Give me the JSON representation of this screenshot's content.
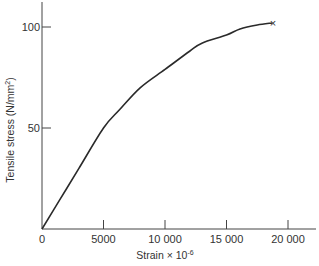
{
  "chart_data": {
    "type": "line",
    "title": "",
    "xlabel": "Strain × 10⁻⁶",
    "ylabel": "Tensile stress (N/mm²)",
    "xlim": [
      0,
      22500
    ],
    "ylim": [
      0,
      112
    ],
    "grid": false,
    "legend": null,
    "x_ticks": [
      0,
      5000,
      10000,
      15000,
      20000
    ],
    "x_tick_labels": [
      "0",
      "5000",
      "10 000",
      "15 000",
      "20 000"
    ],
    "y_ticks": [
      50,
      100
    ],
    "y_tick_labels": [
      "50",
      "100"
    ],
    "origin_label": "0",
    "series": [
      {
        "name": "stress-strain curve",
        "x": [
          0,
          1500,
          3000,
          5000,
          6300,
          8000,
          10000,
          12000,
          13000,
          15000,
          16100,
          17500,
          18700
        ],
        "y": [
          0,
          15,
          30,
          50,
          59,
          70,
          79,
          88,
          92,
          96,
          99,
          101,
          102
        ]
      }
    ],
    "annotations": [
      {
        "type": "marker",
        "symbol": "×",
        "x": 18700,
        "y": 102,
        "meaning": "fracture point"
      }
    ]
  },
  "labels": {
    "x_axis_title": "Strain × 10",
    "x_axis_exponent": "-6",
    "y_axis_title": "Tensile stress (N/mm",
    "y_axis_sup": "2",
    "y_axis_close": ")",
    "end_marker": "×"
  }
}
